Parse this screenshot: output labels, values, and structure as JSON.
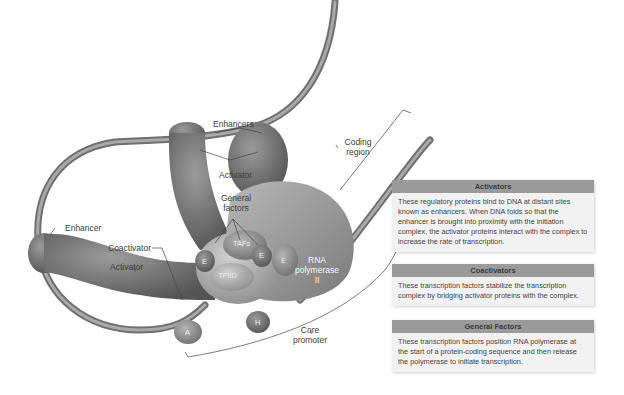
{
  "figure": {
    "labels": {
      "enhancers": "Enhancers",
      "activator_top": "Activator",
      "general_factors": "General factors",
      "enhancer_left": "Enhancer",
      "coactivator": "Coactivator",
      "activator_left": "Activator",
      "coding_region": "Coding region",
      "rna_polymerase": "RNA polymerase II",
      "core_promoter": "Core promoter"
    },
    "protein_labels": {
      "tafs": "TAFs",
      "tfiid": "TFIID",
      "e_left": "E",
      "e_mid": "E",
      "e_right": "E",
      "h": "H",
      "a": "A"
    }
  },
  "info_boxes": [
    {
      "title": "Activators",
      "text": "These regulatory proteins bind to DNA at distant sites known as enhancers. When DNA folds so that the enhancer is brought into proximity with the initiation complex, the activator proteins interact with the complex to increase the rate of transcription."
    },
    {
      "title": "Coactivators",
      "text": "These transcription factors stabilize the transcription complex by bridging activator proteins with the complex."
    },
    {
      "title": "General Factors",
      "text": "These transcription factors position RNA polymerase at the start of a protein-coding sequence and then release the polymerase to initiate transcription."
    }
  ],
  "colors": {
    "box_header": "#9a9a9a",
    "box_body": "#f1f1f1",
    "protein_dark": "#6e6e6e",
    "protein_light": "#a8a8a8",
    "dna": "#8a8a8a"
  }
}
